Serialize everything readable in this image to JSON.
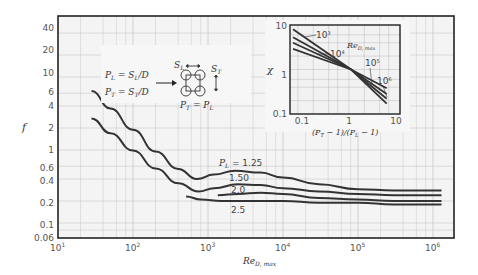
{
  "chart_data": [
    {
      "type": "line",
      "title": "",
      "xlabel": "Re_D,max",
      "ylabel": "f",
      "xscale": "log",
      "yscale": "log",
      "xlim": [
        10,
        2000000
      ],
      "ylim": [
        0.06,
        60
      ],
      "x_tick_labels": [
        "10^1",
        "10^2",
        "10^3",
        "10^4",
        "10^5",
        "10^6"
      ],
      "y_tick_labels": [
        "0.06",
        "0.1",
        "0.2",
        "0.4",
        "0.6",
        "1",
        "2",
        "4",
        "6",
        "10",
        "20",
        "40"
      ],
      "grid": true,
      "series": [
        {
          "name": "P_L = 1.25",
          "x": [
            28,
            50,
            100,
            200,
            400,
            710,
            1200,
            2300,
            5000,
            10000,
            30000,
            100000,
            300000,
            1300000
          ],
          "y": [
            6.4,
            3.7,
            1.9,
            0.95,
            0.55,
            0.4,
            0.46,
            0.52,
            0.49,
            0.42,
            0.34,
            0.29,
            0.28,
            0.28
          ]
        },
        {
          "name": "P_L = 1.50",
          "x": [
            28,
            50,
            100,
            200,
            400,
            750,
            1200,
            2500,
            5000,
            10000,
            30000,
            100000,
            300000,
            1300000
          ],
          "y": [
            2.7,
            1.7,
            0.98,
            0.56,
            0.35,
            0.27,
            0.3,
            0.34,
            0.33,
            0.3,
            0.27,
            0.25,
            0.24,
            0.24
          ]
        },
        {
          "name": "P_L = 2.0",
          "x": [
            1350,
            2500,
            5000,
            10000,
            30000,
            100000,
            300000,
            1300000
          ],
          "y": [
            0.24,
            0.25,
            0.26,
            0.25,
            0.22,
            0.21,
            0.2,
            0.2
          ]
        },
        {
          "name": "P_L = 2.5",
          "x": [
            510,
            800,
            1500,
            3000,
            10000,
            30000,
            100000,
            300000,
            1300000
          ],
          "y": [
            0.23,
            0.21,
            0.2,
            0.2,
            0.2,
            0.19,
            0.19,
            0.18,
            0.18
          ]
        }
      ],
      "annotations": [
        "P_L = 1.25",
        "1.50",
        "2.0",
        "2.5",
        "P_L = S_L/D",
        "P_T = S_T/D",
        "P_T = P_L",
        "S_L",
        "S_T"
      ]
    },
    {
      "type": "line",
      "title": "inset",
      "xlabel": "(P_T - 1)/(P_L - 1)",
      "ylabel": "χ",
      "xscale": "log",
      "yscale": "log",
      "xlim": [
        0.07,
        10
      ],
      "ylim": [
        0.1,
        10
      ],
      "x_tick_labels": [
        "0.1",
        "1",
        "10"
      ],
      "y_tick_labels": [
        "0.1",
        "1",
        "10"
      ],
      "grid": true,
      "legend_title": "Re_D,max",
      "series": [
        {
          "name": "10^3",
          "x": [
            0.08,
            1.1,
            5.5
          ],
          "y": [
            8.0,
            1.0,
            0.17
          ]
        },
        {
          "name": "10^4",
          "x": [
            0.08,
            1.1,
            5.5
          ],
          "y": [
            5.3,
            1.0,
            0.22
          ]
        },
        {
          "name": "10^5",
          "x": [
            0.08,
            1.1,
            5.5
          ],
          "y": [
            4.0,
            1.0,
            0.28
          ]
        },
        {
          "name": "10^6",
          "x": [
            0.08,
            1.1,
            5.5
          ],
          "y": [
            2.9,
            1.0,
            0.38
          ]
        }
      ]
    }
  ],
  "main": {
    "y_axis_label": "f",
    "x_axis_label": "Re",
    "x_axis_sub": "D, max",
    "x_ticks": [
      {
        "base": "10",
        "exp": "1"
      },
      {
        "base": "10",
        "exp": "2"
      },
      {
        "base": "10",
        "exp": "3"
      },
      {
        "base": "10",
        "exp": "4"
      },
      {
        "base": "10",
        "exp": "5"
      },
      {
        "base": "10",
        "exp": "6"
      }
    ],
    "y_ticks": [
      "40",
      "20",
      "10",
      "6",
      "4",
      "2",
      "1",
      "0.6",
      "0.4",
      "0.2",
      "0.1",
      "0.06"
    ],
    "curve_labels": {
      "pl": "P",
      "pl_sub": "L",
      "v125": " = 1.25",
      "v150": "1.50",
      "v20": "2.0",
      "v25": "2.5"
    }
  },
  "legend_box": {
    "eq1_lhs": "P",
    "eq1_lhs_sub": "L",
    "eq1_rhs": " = S",
    "eq1_rhs_sub": "L",
    "eq1_tail": "/D",
    "eq2_lhs": "P",
    "eq2_lhs_sub": "T",
    "eq2_rhs": " = S",
    "eq2_rhs_sub": "T",
    "eq2_tail": "/D",
    "sl": "S",
    "sl_sub": "L",
    "st": "S",
    "st_sub": "T",
    "eq3": "P",
    "eq3_sub": "T",
    "eq3_mid": " = P",
    "eq3_sub2": "L"
  },
  "inset": {
    "y_axis_label": "χ",
    "x_axis_label": "(P",
    "x_axis_sub1": "T",
    "x_axis_mid": " − 1)/(P",
    "x_axis_sub2": "L",
    "x_axis_tail": " − 1)",
    "y_ticks": [
      "10",
      "1",
      "0.1"
    ],
    "x_ticks": [
      "0.1",
      "1",
      "10"
    ],
    "legend_re": "Re",
    "legend_re_sub": "D, max",
    "labels": [
      {
        "base": "10",
        "exp": "3"
      },
      {
        "base": "10",
        "exp": "4"
      },
      {
        "base": "10",
        "exp": "5"
      },
      {
        "base": "10",
        "exp": "6"
      }
    ]
  }
}
